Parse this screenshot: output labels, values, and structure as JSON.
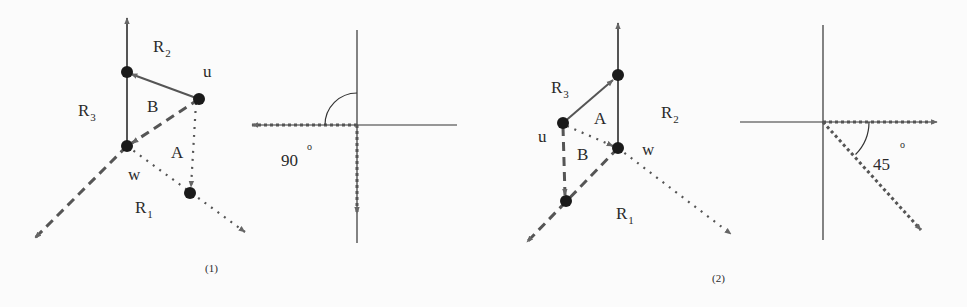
{
  "figures": [
    {
      "id": "fig1",
      "caption": "(1)",
      "caption_pos": [
        205,
        272
      ],
      "nodes": {
        "top": [
          127,
          72
        ],
        "u": [
          199,
          99
        ],
        "w": [
          127,
          146
        ],
        "bottom": [
          190,
          193
        ]
      },
      "edges": [
        {
          "name": "vertical-up-arrow",
          "from": [
            127,
            146
          ],
          "to": [
            127,
            18
          ],
          "style": "solid",
          "arrow": true
        },
        {
          "name": "u-to-top-arrow",
          "from": [
            199,
            99
          ],
          "to": [
            131,
            74
          ],
          "style": "solid",
          "arrow": true
        },
        {
          "name": "u-to-w-dashed-arrow",
          "from": [
            199,
            99
          ],
          "to": [
            132,
            143
          ],
          "style": "dashed",
          "arrow": true
        },
        {
          "name": "w-dashed-down-left-arrow",
          "from": [
            127,
            146
          ],
          "to": [
            35,
            238
          ],
          "style": "dashed",
          "arrow": true
        },
        {
          "name": "u-to-bottom-dotted-arrow",
          "from": [
            196,
            103
          ],
          "to": [
            191,
            187
          ],
          "style": "dotted",
          "arrow": true
        },
        {
          "name": "w-dotted-down-right-arrow",
          "from": [
            127,
            146
          ],
          "to": [
            245,
            232
          ],
          "style": "dotted",
          "arrow": true
        }
      ],
      "labels": [
        {
          "text": "R",
          "sub": "2",
          "pos": [
            153,
            52
          ]
        },
        {
          "text": "u",
          "pos": [
            203,
            77
          ]
        },
        {
          "text": "R",
          "sub": "3",
          "pos": [
            78,
            116
          ]
        },
        {
          "text": "B",
          "pos": [
            147,
            112
          ]
        },
        {
          "text": "A",
          "pos": [
            171,
            158
          ]
        },
        {
          "text": "w",
          "pos": [
            128,
            180
          ]
        },
        {
          "text": "R",
          "sub": "1",
          "pos": [
            135,
            213
          ]
        }
      ],
      "axes": {
        "origin": [
          357,
          125
        ],
        "h": [
          255,
          457
        ],
        "v": [
          30,
          243
        ],
        "vectors": [
          {
            "name": "left-vector",
            "to": [
              252,
              125
            ],
            "style": "dense"
          },
          {
            "name": "down-vector",
            "to": [
              357,
              213
            ],
            "style": "dense"
          }
        ],
        "arc": {
          "r": 32,
          "start_deg": 180,
          "end_deg": 90
        },
        "angle_label": "90",
        "degree_symbol": "o",
        "angle_label_pos": [
          281,
          166
        ],
        "degree_pos": [
          307,
          150
        ]
      }
    },
    {
      "id": "fig2",
      "caption": "(2)",
      "caption_pos": [
        712,
        282
      ],
      "nodes": {
        "top": [
          618,
          75
        ],
        "u": [
          563,
          123
        ],
        "w": [
          618,
          148
        ],
        "bottom": [
          566,
          201
        ]
      },
      "edges": [
        {
          "name": "vertical-up-arrow",
          "from": [
            618,
            148
          ],
          "to": [
            618,
            23
          ],
          "style": "solid",
          "arrow": true
        },
        {
          "name": "u-to-top-arrow",
          "from": [
            563,
            123
          ],
          "to": [
            613,
            80
          ],
          "style": "solid",
          "arrow": true
        },
        {
          "name": "u-to-w-dotted-arrow",
          "from": [
            567,
            126
          ],
          "to": [
            613,
            146
          ],
          "style": "dotted",
          "arrow": true
        },
        {
          "name": "u-to-bottom-dashed-arrow",
          "from": [
            563,
            127
          ],
          "to": [
            565,
            195
          ],
          "style": "dashed",
          "arrow": true
        },
        {
          "name": "w-dashed-down-left-arrow",
          "from": [
            618,
            148
          ],
          "to": [
            527,
            242
          ],
          "style": "dashed",
          "arrow": true
        },
        {
          "name": "w-dotted-down-right-arrow",
          "from": [
            618,
            148
          ],
          "to": [
            731,
            234
          ],
          "style": "dotted",
          "arrow": true
        }
      ],
      "labels": [
        {
          "text": "R",
          "sub": "3",
          "pos": [
            551,
            93
          ]
        },
        {
          "text": "A",
          "pos": [
            594,
            124
          ]
        },
        {
          "text": "R",
          "sub": "2",
          "pos": [
            661,
            118
          ]
        },
        {
          "text": "u",
          "pos": [
            538,
            142
          ]
        },
        {
          "text": "B",
          "pos": [
            577,
            160
          ]
        },
        {
          "text": "w",
          "pos": [
            642,
            155
          ]
        },
        {
          "text": "R",
          "sub": "1",
          "pos": [
            616,
            219
          ]
        }
      ],
      "axes": {
        "origin": [
          823,
          122
        ],
        "h": [
          740,
          937
        ],
        "v": [
          25,
          240
        ],
        "vectors": [
          {
            "name": "right-vector",
            "to": [
              937,
              122
            ],
            "style": "dense"
          },
          {
            "name": "diagonal-vector",
            "to": [
              921,
              230
            ],
            "style": "dense"
          }
        ],
        "arc": {
          "r": 46,
          "start_deg": 0,
          "end_deg": -45
        },
        "angle_label": "45",
        "degree_symbol": "o",
        "angle_label_pos": [
          873,
          170
        ],
        "degree_pos": [
          900,
          148
        ]
      }
    }
  ],
  "colors": {
    "line": "#555555",
    "node": "#1a1a1a",
    "axis": "#333333",
    "text": "#2a2a2a"
  }
}
